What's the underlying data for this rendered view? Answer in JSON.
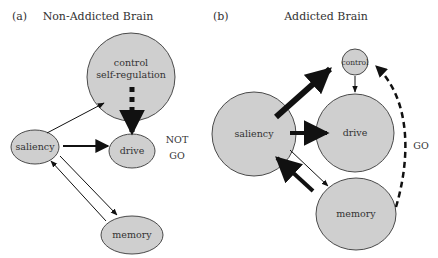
{
  "figure": {
    "colors": {
      "node_fill": "#cfcfcf",
      "node_stroke": "#4a4a4a",
      "arrow": "#111111",
      "text": "#333333",
      "background": "#ffffff"
    },
    "panel_a": {
      "tag": "(a)",
      "title": "Non-Addicted Brain",
      "nodes": {
        "control_line1": "control",
        "control_line2": "self-regulation",
        "saliency": "saliency",
        "drive": "drive",
        "memory": "memory"
      },
      "annotation_line1": "NOT",
      "annotation_line2": "GO"
    },
    "panel_b": {
      "tag": "(b)",
      "title": "Addicted Brain",
      "nodes": {
        "control": "control",
        "saliency": "saliency",
        "drive": "drive",
        "memory": "memory"
      },
      "annotation": "GO"
    }
  }
}
